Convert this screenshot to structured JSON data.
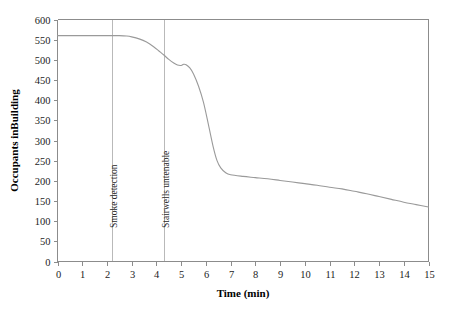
{
  "chart_data": {
    "type": "line",
    "title": "",
    "xlabel": "Time (min)",
    "ylabel": "Occupants inBuilding",
    "xlim": [
      0,
      15
    ],
    "ylim": [
      0,
      600
    ],
    "grid": false,
    "legend": "none",
    "x_ticks": [
      "0",
      "1",
      "2",
      "3",
      "4",
      "5",
      "6",
      "7",
      "8",
      "9",
      "10",
      "11",
      "12",
      "13",
      "14",
      "15"
    ],
    "y_ticks": [
      "0",
      "50",
      "100",
      "150",
      "200",
      "250",
      "300",
      "350",
      "400",
      "450",
      "500",
      "550",
      "600"
    ],
    "series": [
      {
        "name": "Occupants in building",
        "color": "#9a9a9a",
        "x": [
          0,
          0.5,
          1,
          1.5,
          2,
          2.2,
          2.5,
          2.8,
          3,
          3.3,
          3.6,
          3.9,
          4.1,
          4.3,
          4.5,
          4.7,
          4.85,
          5,
          5.1,
          5.2,
          5.35,
          5.5,
          5.7,
          5.9,
          6.1,
          6.3,
          6.45,
          6.6,
          6.8,
          7,
          7.5,
          8,
          8.5,
          9,
          9.5,
          10,
          10.5,
          11,
          11.5,
          12,
          12.5,
          13,
          13.5,
          14,
          14.5,
          15
        ],
        "y": [
          560,
          560,
          560,
          560,
          560,
          560,
          560,
          559,
          557,
          552,
          544,
          532,
          522,
          512,
          501,
          492,
          487,
          486,
          489,
          488,
          480,
          465,
          435,
          395,
          340,
          283,
          250,
          232,
          220,
          215,
          211,
          208,
          205,
          201,
          197,
          193,
          189,
          184,
          180,
          174,
          168,
          161,
          154,
          147,
          141,
          135
        ]
      }
    ],
    "annotations": [
      {
        "label": "Smoke detection",
        "x": 2.2,
        "orientation": "vertical"
      },
      {
        "label": "Stairwells untenable",
        "x": 4.3,
        "orientation": "vertical"
      }
    ],
    "colors": {
      "curve": "#9a9a9a",
      "axis": "#8c8c8c",
      "event_line": "#b9b9b9",
      "text": "#1c1c1c",
      "background": "#ffffff"
    }
  }
}
